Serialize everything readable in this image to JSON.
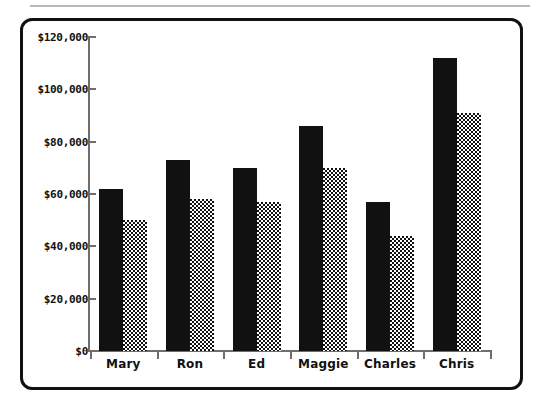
{
  "chart_data": {
    "type": "bar",
    "title": "",
    "subtitle": "",
    "xlabel": "",
    "ylabel": "",
    "categories": [
      "Mary",
      "Ron",
      "Ed",
      "Maggie",
      "Charles",
      "Chris"
    ],
    "series": [
      {
        "name": "series-1",
        "fill": "solid",
        "values": [
          62000,
          73000,
          70000,
          86000,
          57000,
          112000
        ]
      },
      {
        "name": "series-2",
        "fill": "checkered",
        "values": [
          50000,
          58000,
          57000,
          70000,
          44000,
          91000
        ]
      }
    ],
    "ylim": [
      0,
      120000
    ],
    "ytick_values": [
      0,
      20000,
      40000,
      60000,
      80000,
      100000,
      120000
    ],
    "ytick_labels": [
      "$0",
      "$20,000",
      "$40,000",
      "$60,000",
      "$80,000",
      "$100,000",
      "$120,000"
    ],
    "grid": false,
    "legend": null,
    "legend_position": "none",
    "annotations": [],
    "colors": {
      "series_1": "#111111",
      "series_2_base": "#111111",
      "series_2_pattern": "#ffffff",
      "axis": "#6e6e6e",
      "frame": "#111111",
      "background": "#ffffff",
      "rule": "#b9b9b9"
    }
  }
}
